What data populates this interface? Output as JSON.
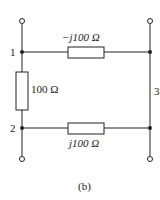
{
  "diagram": {
    "caption": "(b)",
    "nodes": [
      {
        "id": "1",
        "label": "1"
      },
      {
        "id": "2",
        "label": "2"
      },
      {
        "id": "3",
        "label": "3"
      }
    ],
    "components": [
      {
        "type": "impedance",
        "between": [
          "1",
          "3"
        ],
        "label": "−j100 Ω"
      },
      {
        "type": "impedance",
        "between": [
          "1",
          "2"
        ],
        "label": "100 Ω"
      },
      {
        "type": "impedance",
        "between": [
          "2",
          "3"
        ],
        "label": "j100 Ω"
      }
    ],
    "terminals": 4
  }
}
